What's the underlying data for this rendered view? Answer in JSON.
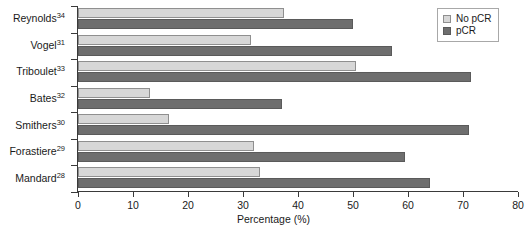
{
  "chart_data": {
    "type": "bar",
    "orientation": "horizontal",
    "title": "",
    "xlabel": "Percentage (%)",
    "ylabel": "",
    "xlim": [
      0,
      80
    ],
    "xticks": [
      0,
      10,
      20,
      30,
      40,
      50,
      60,
      70,
      80
    ],
    "grid": false,
    "legend_position": "top-right",
    "categories": [
      "Reynolds",
      "Vogel",
      "Triboulet",
      "Bates",
      "Smithers",
      "Forastiere",
      "Mandard"
    ],
    "category_refs": [
      "34",
      "31",
      "33",
      "32",
      "30",
      "29",
      "28"
    ],
    "category_labels": [
      "Reynolds34",
      "Vogel31",
      "Triboulet33",
      "Bates32",
      "Smithers30",
      "Forastiere29",
      "Mandard28"
    ],
    "series": [
      {
        "name": "No pCR",
        "color": "#d7d7d7",
        "values": [
          37.5,
          31.5,
          50.5,
          13.0,
          16.5,
          32.0,
          33.0
        ]
      },
      {
        "name": "pCR",
        "color": "#6e6e6e",
        "values": [
          50.0,
          57.0,
          71.5,
          37.0,
          71.0,
          59.5,
          64.0
        ]
      }
    ]
  },
  "legend": {
    "items": [
      {
        "label": "No pCR",
        "swatch": "light-gray-swatch"
      },
      {
        "label": "pCR",
        "swatch": "dark-gray-swatch"
      }
    ]
  },
  "axis": {
    "x_title": "Percentage (%)",
    "x_tick_labels": [
      "0",
      "10",
      "20",
      "30",
      "40",
      "50",
      "60",
      "70",
      "80"
    ]
  },
  "colors": {
    "no_pcr": "#d7d7d7",
    "pcr": "#6e6e6e",
    "axis": "#3a3a3a",
    "background": "#ffffff"
  }
}
